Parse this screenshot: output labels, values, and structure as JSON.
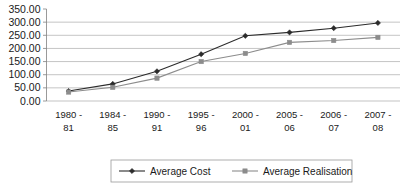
{
  "chart_data": {
    "type": "line",
    "title": "",
    "xlabel": "",
    "ylabel": "",
    "ylim": [
      0,
      350
    ],
    "ytick_step": 50,
    "grid": true,
    "legend_position": "bottom",
    "categories": [
      "1980 -\n81",
      "1984 -\n85",
      "1990 -\n91",
      "1995 -\n96",
      "2000 -\n01",
      "2005 -\n06",
      "2006 -\n07",
      "2007 -\n08"
    ],
    "category_lines": [
      [
        "1980 -",
        "81"
      ],
      [
        "1984 -",
        "85"
      ],
      [
        "1990 -",
        "91"
      ],
      [
        "1995 -",
        "96"
      ],
      [
        "2000 -",
        "01"
      ],
      [
        "2005 -",
        "06"
      ],
      [
        "2006 -",
        "07"
      ],
      [
        "2007 -",
        "08"
      ]
    ],
    "ytick_labels": [
      "0.00",
      "50.00",
      "100.00",
      "150.00",
      "200.00",
      "250.00",
      "300.00",
      "350.00"
    ],
    "ytick_values": [
      0,
      50,
      100,
      150,
      200,
      250,
      300,
      350
    ],
    "series": [
      {
        "name": "Average Cost",
        "marker": "diamond",
        "color": "#2b2b2b",
        "values": [
          38,
          65,
          113,
          178,
          248,
          261,
          277,
          297
        ]
      },
      {
        "name": "Average Realisation",
        "marker": "square",
        "color": "#8c8c8c",
        "values": [
          34,
          52,
          87,
          150,
          181,
          223,
          230,
          242
        ]
      }
    ]
  },
  "legend": {
    "items": [
      {
        "label": "Average Cost"
      },
      {
        "label": "Average Realisation"
      }
    ]
  },
  "colors": {
    "series_cost": "#2b2b2b",
    "series_realisation": "#8c8c8c",
    "gridline": "#aaaaaa",
    "axis": "#808080",
    "background": "#ffffff"
  }
}
